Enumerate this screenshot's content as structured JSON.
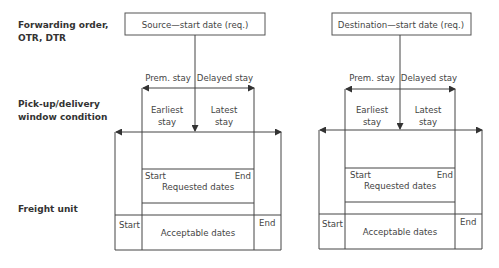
{
  "row_labels": {
    "forwarding_order": "Forwarding order,",
    "forwarding_order_line2": "OTR, DTR",
    "pickup_window": "Pick-up/delivery",
    "pickup_window_line2": "window condition",
    "freight_unit": "Freight unit"
  },
  "diagrams": [
    {
      "title": "Source—start date (req.)",
      "prem_stay": "Prem. stay",
      "delayed_stay": "Delayed stay",
      "earliest_1": "Earliest",
      "earliest_2": "stay",
      "latest_1": "Latest",
      "latest_2": "stay",
      "req_start": "Start",
      "req_end": "End",
      "requested_dates": "Requested dates",
      "acc_start": "Start",
      "acc_end": "End",
      "acceptable_dates": "Acceptable dates"
    },
    {
      "title": "Destination—start date (req.)",
      "prem_stay": "Prem. stay",
      "delayed_stay": "Delayed stay",
      "earliest_1": "Earliest",
      "earliest_2": "stay",
      "latest_1": "Latest",
      "latest_2": "stay",
      "req_start": "Start",
      "req_end": "End",
      "requested_dates": "Requested dates",
      "acc_start": "Start",
      "acc_end": "End",
      "acceptable_dates": "Acceptable dates"
    }
  ]
}
